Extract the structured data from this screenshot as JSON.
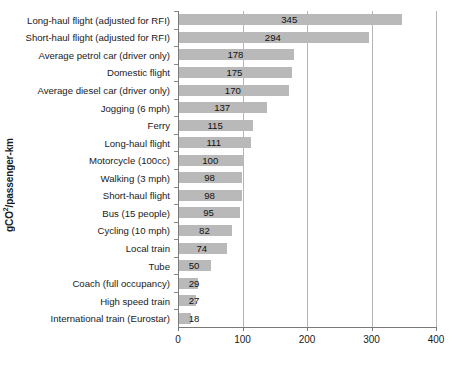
{
  "chart_data": {
    "type": "bar",
    "orientation": "horizontal",
    "title": "",
    "xlabel": "",
    "ylabel": "gCO²/passenger-km",
    "ylabel_prefix": "gCO",
    "ylabel_sup": "2",
    "ylabel_suffix": "/passenger-km",
    "xlim": [
      0,
      400
    ],
    "xticks": [
      0,
      100,
      200,
      300,
      400
    ],
    "xticklabels": [
      "0",
      "100",
      "200",
      "300",
      "400"
    ],
    "grid": true,
    "grid_axis": "x",
    "legend": false,
    "bar_color": "#b9b9b9",
    "grid_color": "#b5b5b5",
    "axis_color": "#7a7a7a",
    "text_color": "#1a1a1a",
    "categories": [
      "Long-haul flight (adjusted for RFI)",
      "Short-haul flight (adjusted for RFI)",
      "Average petrol car (driver only)",
      "Domestic flight",
      "Average diesel car (driver only)",
      "Jogging (6 mph)",
      "Ferry",
      "Long-haul flight",
      "Motorcycle (100cc)",
      "Walking (3 mph)",
      "Short-haul flight",
      "Bus (15 people)",
      "Cycling (10 mph)",
      "Local train",
      "Tube",
      "Coach (full occupancy)",
      "High speed train",
      "International train (Eurostar)"
    ],
    "values": [
      345,
      294,
      178,
      175,
      170,
      137,
      115,
      111,
      100,
      98,
      98,
      95,
      82,
      74,
      50,
      29,
      27,
      18
    ],
    "value_labels": [
      "345",
      "294",
      "178",
      "175",
      "170",
      "137",
      "115",
      "111",
      "100",
      "98",
      "98",
      "95",
      "82",
      "74",
      "50",
      "29",
      "27",
      "18"
    ]
  }
}
